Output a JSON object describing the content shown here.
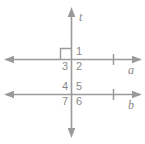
{
  "figure": {
    "stroke_color": "#9a9a9a",
    "label_color": "#8a8a8a",
    "background_color": "#ffffff",
    "lines": [
      {
        "id": "t",
        "label": "t",
        "orientation": "vertical",
        "role": "transversal"
      },
      {
        "id": "a",
        "label": "a",
        "orientation": "horizontal",
        "role": "parallel-line"
      },
      {
        "id": "b",
        "label": "b",
        "orientation": "horizontal",
        "role": "parallel-line"
      }
    ],
    "right_angle_marks": [
      {
        "at_intersection": "t-and-a",
        "quadrant": "upper-left"
      }
    ],
    "angles": [
      {
        "number": "1",
        "intersection": "t-and-a",
        "quadrant": "upper-right"
      },
      {
        "number": "2",
        "intersection": "t-and-a",
        "quadrant": "lower-right"
      },
      {
        "number": "3",
        "intersection": "t-and-a",
        "quadrant": "lower-left"
      },
      {
        "number": "4",
        "intersection": "t-and-b",
        "quadrant": "upper-left"
      },
      {
        "number": "5",
        "intersection": "t-and-b",
        "quadrant": "upper-right"
      },
      {
        "number": "6",
        "intersection": "t-and-b",
        "quadrant": "lower-right"
      },
      {
        "number": "7",
        "intersection": "t-and-b",
        "quadrant": "lower-left"
      }
    ],
    "labels": {
      "t": "t",
      "a": "a",
      "b": "b",
      "n1": "1",
      "n2": "2",
      "n3": "3",
      "n4": "4",
      "n5": "5",
      "n6": "6",
      "n7": "7"
    }
  }
}
